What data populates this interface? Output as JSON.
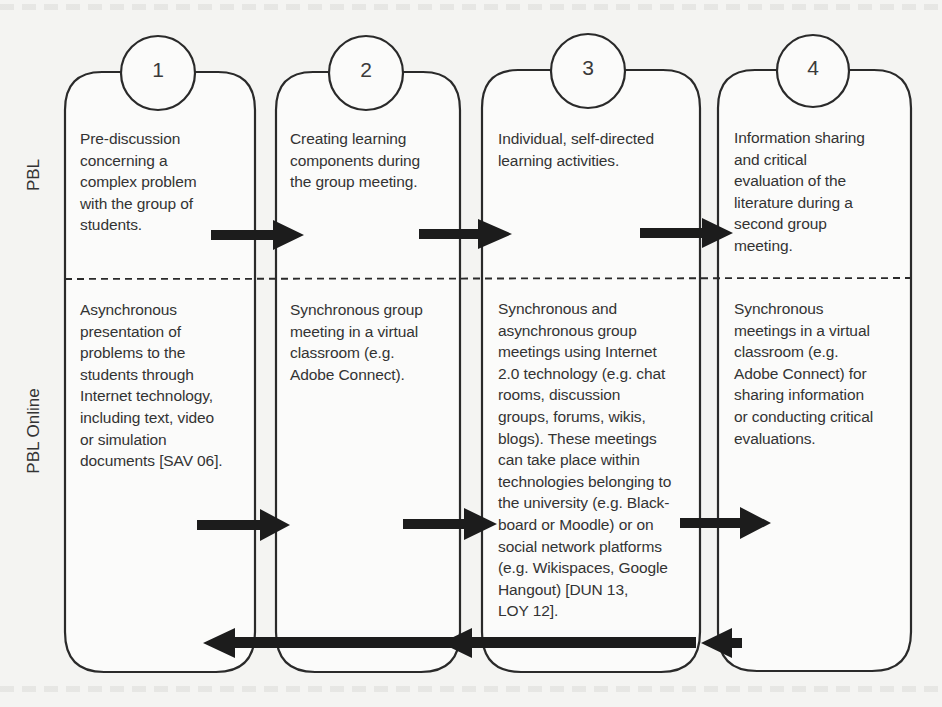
{
  "diagram": {
    "row_labels": {
      "pbl": "PBL",
      "online": "PBL Online"
    },
    "colors": {
      "stroke": "#2a2a2a",
      "arrow": "#1c1c1c",
      "background": "#f4f4f2",
      "box_fill": "#fbfbfa"
    },
    "steps": [
      {
        "number": "1",
        "pbl": "Pre-discussion\nconcerning a\ncomplex problem\nwith the group of\nstudents.",
        "online": "Asynchronous\npresentation of\nproblems to the\nstudents through\nInternet technology,\nincluding text, video\nor simulation\ndocuments [SAV 06]."
      },
      {
        "number": "2",
        "pbl": "Creating learning\ncomponents during\nthe group meeting.",
        "online": "Synchronous group\nmeeting in a virtual\nclassroom (e.g.\nAdobe Connect)."
      },
      {
        "number": "3",
        "pbl": "Individual, self-directed\nlearning activities.",
        "online": "Synchronous and\nasynchronous group\nmeetings using Internet\n2.0 technology (e.g. chat\nrooms, discussion\ngroups, forums, wikis,\nblogs). These meetings\ncan take place within\ntechnologies belonging to\nthe university (e.g. Black-\nboard or Moodle) or on\nsocial network platforms\n(e.g. Wikispaces, Google\nHangout) [DUN 13,\nLOY 12]."
      },
      {
        "number": "4",
        "pbl": "Information sharing\nand critical\nevaluation of the\nliterature during a\nsecond group\nmeeting.",
        "online": "Synchronous\nmeetings in a virtual\nclassroom (e.g.\nAdobe Connect) for\nsharing information\nor conducting critical\nevaluations."
      }
    ],
    "arrows": {
      "pbl_forward": [
        {
          "from": "1",
          "to": "2"
        },
        {
          "from": "2",
          "to": "3"
        },
        {
          "from": "3",
          "to": "4"
        }
      ],
      "online_forward": [
        {
          "from": "1",
          "to": "2"
        },
        {
          "from": "2",
          "to": "3"
        },
        {
          "from": "3",
          "to": "4"
        }
      ],
      "online_return": [
        {
          "from": "4",
          "to": "3"
        },
        {
          "from": "3",
          "to": "2"
        },
        {
          "from": "2",
          "to": "1"
        }
      ]
    }
  }
}
